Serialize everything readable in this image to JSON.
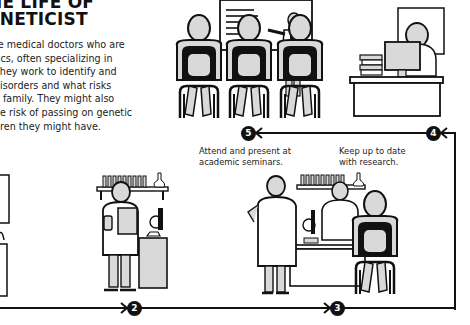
{
  "title": {
    "line1": "HE LIFE OF",
    "line2": "ENETICIST"
  },
  "intro": {
    "lines": [
      "re medical doctors who are",
      "tics, often specializing in",
      "They work to identify and",
      "disorders and what risks",
      "a family. They might also",
      "he risk of passing on genetic",
      "dren they might have."
    ]
  },
  "steps": [
    {
      "number": "2",
      "caption": []
    },
    {
      "number": "3",
      "caption": []
    },
    {
      "number": "4",
      "caption": [
        "Keep up to date",
        "with research."
      ]
    },
    {
      "number": "5",
      "caption": [
        "Attend and present at",
        "academic seminars."
      ]
    }
  ],
  "illustrations": [
    {
      "name": "seminar-audience",
      "description": "audience seated watching presenter at whiteboard"
    },
    {
      "name": "researcher-desk",
      "description": "geneticist at desk with computer and books"
    },
    {
      "name": "lab-scientist",
      "description": "scientist in lab coat holding clipboard near microscope"
    },
    {
      "name": "lab-consultation",
      "description": "colleagues and patient at lab bench"
    }
  ],
  "colors": {
    "ink": "#111111",
    "fill_gray": "#d9d9d9",
    "background": "#ffffff"
  }
}
